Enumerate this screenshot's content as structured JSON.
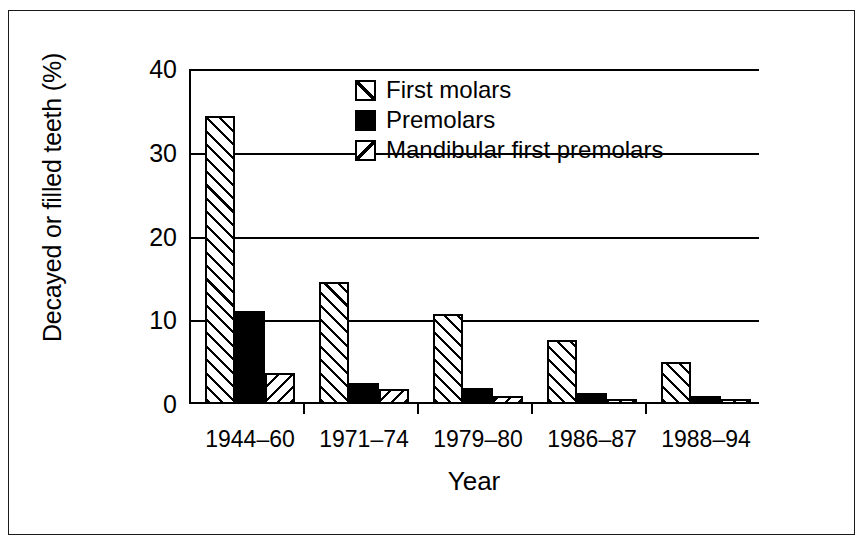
{
  "chart_data": {
    "type": "bar",
    "title": "",
    "xlabel": "Year",
    "ylabel": "Decayed or filled teeth (%)",
    "categories": [
      "1944–60",
      "1971–74",
      "1979–80",
      "1986–87",
      "1988–94"
    ],
    "series": [
      {
        "name": "First molars",
        "pattern": "hatch-forward-diagonal",
        "values": [
          34.4,
          14.6,
          10.8,
          7.7,
          5.0
        ]
      },
      {
        "name": "Premolars",
        "pattern": "solid-black",
        "values": [
          11.1,
          2.5,
          1.9,
          1.3,
          0.9
        ]
      },
      {
        "name": "Mandibular first premolars",
        "pattern": "hatch-backward-diagonal",
        "values": [
          3.7,
          1.8,
          1.0,
          0.6,
          0.6
        ]
      }
    ],
    "ylim": [
      0,
      40
    ],
    "y_ticks": [
      0,
      10,
      20,
      30,
      40
    ],
    "y_tick_labels": [
      "0",
      "10",
      "20",
      "30",
      "40"
    ],
    "grid": "horizontal",
    "legend_position": "upper-center"
  },
  "colors": {
    "ink": "#000000",
    "background": "#ffffff",
    "frame": "#1a1a1a"
  }
}
